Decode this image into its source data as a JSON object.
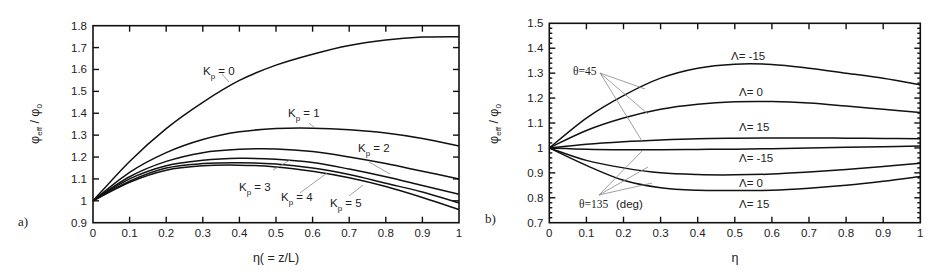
{
  "chart_data": [
    {
      "type": "line",
      "panel_label": "a)",
      "title": "",
      "xlabel": "η( = z/L)",
      "ylabel": "φeff / φ0",
      "xlim": [
        0,
        1
      ],
      "ylim": [
        0.9,
        1.8
      ],
      "xticks": [
        "0",
        "0.1",
        "0.2",
        "0.3",
        "0.4",
        "0.5",
        "0.6",
        "0.7",
        "0.8",
        "0.9",
        "1"
      ],
      "yticks": [
        "0.9",
        "1",
        "1.1",
        "1.2",
        "1.3",
        "1.4",
        "1.5",
        "1.6",
        "1.7",
        "1.8"
      ],
      "grid": false,
      "legend": "inline annotations",
      "x": [
        0,
        0.1,
        0.2,
        0.3,
        0.4,
        0.5,
        0.6,
        0.7,
        0.8,
        0.9,
        1.0
      ],
      "series": [
        {
          "name": "Kp = 0",
          "values": [
            1.0,
            1.18,
            1.33,
            1.45,
            1.55,
            1.62,
            1.67,
            1.71,
            1.735,
            1.748,
            1.75
          ]
        },
        {
          "name": "Kp = 1",
          "values": [
            1.0,
            1.13,
            1.22,
            1.28,
            1.315,
            1.33,
            1.332,
            1.325,
            1.31,
            1.285,
            1.25
          ]
        },
        {
          "name": "Kp = 2",
          "values": [
            1.0,
            1.11,
            1.18,
            1.22,
            1.235,
            1.237,
            1.225,
            1.2,
            1.17,
            1.135,
            1.1
          ]
        },
        {
          "name": "Kp = 3",
          "values": [
            1.0,
            1.1,
            1.16,
            1.185,
            1.194,
            1.19,
            1.175,
            1.145,
            1.11,
            1.07,
            1.03
          ]
        },
        {
          "name": "Kp = 4",
          "values": [
            1.0,
            1.09,
            1.15,
            1.17,
            1.174,
            1.168,
            1.15,
            1.12,
            1.08,
            1.04,
            0.99
          ]
        },
        {
          "name": "Kp = 5",
          "values": [
            1.0,
            1.085,
            1.14,
            1.16,
            1.163,
            1.155,
            1.135,
            1.105,
            1.065,
            1.015,
            0.96
          ]
        }
      ],
      "annotations": [
        {
          "text": "K",
          "sub": "p",
          "rest": " = 0"
        },
        {
          "text": "K",
          "sub": "p",
          "rest": " = 1"
        },
        {
          "text": "K",
          "sub": "p",
          "rest": " = 2"
        },
        {
          "text": "K",
          "sub": "p",
          "rest": " = 3"
        },
        {
          "text": "K",
          "sub": "p",
          "rest": " = 4"
        },
        {
          "text": "K",
          "sub": "p",
          "rest": " = 5"
        }
      ]
    },
    {
      "type": "line",
      "panel_label": "b)",
      "title": "",
      "xlabel": "η",
      "ylabel": "φeff / φ0",
      "xlim": [
        0,
        1
      ],
      "ylim": [
        0.7,
        1.5
      ],
      "xticks": [
        "0",
        "0.1",
        "0.2",
        "0.3",
        "0.4",
        "0.5",
        "0.6",
        "0.7",
        "0.8",
        "0.9",
        "1"
      ],
      "yticks": [
        "0.7",
        "0.8",
        "0.9",
        "1",
        "1.1",
        "1.2",
        "1.3",
        "1.4",
        "1.5"
      ],
      "grid": false,
      "legend": "inline annotations",
      "x": [
        0,
        0.1,
        0.2,
        0.3,
        0.4,
        0.5,
        0.6,
        0.7,
        0.8,
        0.9,
        1.0
      ],
      "series": [
        {
          "name": "θ=45, Λ= -15",
          "values": [
            1.0,
            1.12,
            1.21,
            1.28,
            1.32,
            1.336,
            1.335,
            1.32,
            1.3,
            1.28,
            1.253
          ]
        },
        {
          "name": "θ=45, Λ= 0",
          "values": [
            1.0,
            1.07,
            1.12,
            1.155,
            1.175,
            1.185,
            1.186,
            1.18,
            1.168,
            1.155,
            1.142
          ]
        },
        {
          "name": "θ=45, Λ= 15",
          "values": [
            1.0,
            1.015,
            1.025,
            1.032,
            1.037,
            1.039,
            1.04,
            1.04,
            1.039,
            1.038,
            1.037
          ]
        },
        {
          "name": "θ=135, Λ= -15",
          "values": [
            1.0,
            0.995,
            0.993,
            0.993,
            0.994,
            0.995,
            0.997,
            1.0,
            1.003,
            1.005,
            1.008
          ]
        },
        {
          "name": "θ=135, Λ= 0",
          "values": [
            1.0,
            0.95,
            0.92,
            0.9,
            0.893,
            0.892,
            0.895,
            0.903,
            0.913,
            0.925,
            0.939
          ]
        },
        {
          "name": "θ=135, Λ= 15",
          "values": [
            1.0,
            0.93,
            0.87,
            0.84,
            0.83,
            0.829,
            0.83,
            0.838,
            0.85,
            0.866,
            0.885
          ]
        }
      ],
      "annotations": [
        {
          "text": "Λ=  -15"
        },
        {
          "text": "Λ=  0"
        },
        {
          "text": "Λ=  15"
        },
        {
          "text": "Λ=  -15"
        },
        {
          "text": "Λ=  0"
        },
        {
          "text": "Λ=  15"
        },
        {
          "text": "θ=45"
        },
        {
          "text": "θ=135"
        },
        {
          "text": "(deg)"
        }
      ]
    }
  ]
}
